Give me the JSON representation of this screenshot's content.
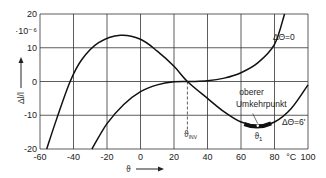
{
  "chart_data": {
    "type": "line",
    "title": "",
    "xlabel": "ϑ",
    "x_unit": "°C",
    "ylabel": "Δl/l",
    "y_scale_note": "·10⁻⁶",
    "xlim": [
      -60,
      100
    ],
    "ylim": [
      -20,
      20
    ],
    "xticks": [
      -60,
      -40,
      -20,
      0,
      20,
      40,
      60,
      80,
      100
    ],
    "yticks": [
      -20,
      -10,
      0,
      10,
      20
    ],
    "grid": true,
    "series": [
      {
        "name": "ΔΘ=0",
        "x": [
          -29,
          -20,
          -10,
          0,
          10,
          20,
          30,
          40,
          50,
          60,
          70,
          80,
          86
        ],
        "y": [
          -20,
          -12.5,
          -6.8,
          -3,
          -1,
          -0.1,
          0,
          0.2,
          1,
          2.6,
          5.5,
          11,
          20
        ]
      },
      {
        "name": "ΔΘ=6'",
        "x": [
          -56,
          -50,
          -42,
          -35,
          -25,
          -12,
          0,
          10,
          20,
          28,
          40,
          50,
          60,
          70,
          80,
          90,
          100
        ],
        "y": [
          -20,
          -11,
          0,
          6.5,
          11.5,
          13.7,
          12.5,
          9,
          4.5,
          0,
          -5,
          -9,
          -12,
          -13,
          -12,
          -8,
          -1
        ]
      }
    ],
    "annotations": [
      {
        "text": "ΔΘ=0",
        "x": 82,
        "y": 12
      },
      {
        "text": "ΔΘ=6'",
        "x": 82,
        "y": -13
      },
      {
        "text": "oberer",
        "x": 62,
        "y": -5
      },
      {
        "text": "Umkehrpunkt",
        "x": 62,
        "y": -8
      },
      {
        "text": "ϑ_INV",
        "x": 28,
        "y": -16,
        "marker": "dashed vertical line at x=28"
      },
      {
        "text": "ϑ₁",
        "x": 70,
        "y": -17,
        "marker": "thick band on ΔΘ=6' curve around x=62..78"
      }
    ],
    "legend_position": "inline"
  }
}
